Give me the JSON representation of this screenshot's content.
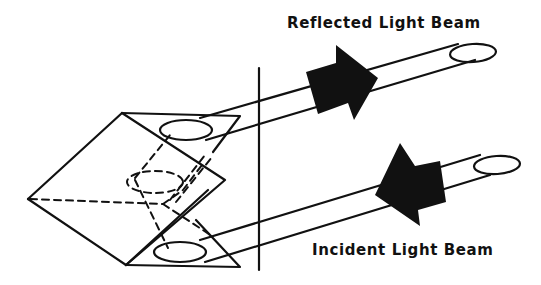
{
  "diagram": {
    "labels": {
      "reflected": "Reflected Light Beam",
      "incident": "Incident Light Beam"
    },
    "colors": {
      "ink": "#111111",
      "background": "#ffffff"
    },
    "components": [
      {
        "id": "prism",
        "name": "Corner cube prism"
      },
      {
        "id": "reference-plane",
        "name": "Vertical reference line"
      },
      {
        "id": "reflected-beam",
        "name": "Reflected light beam with outgoing arrow"
      },
      {
        "id": "incident-beam",
        "name": "Incident light beam with incoming arrow"
      }
    ]
  }
}
